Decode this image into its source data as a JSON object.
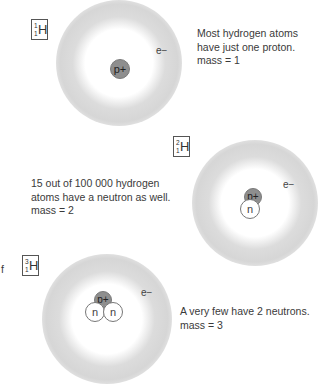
{
  "isotopes": [
    {
      "id": "protium",
      "label": {
        "mass_number": "1",
        "atomic_number": "1",
        "symbol": "H"
      },
      "nucleus": {
        "proton": "p+",
        "neutrons": []
      },
      "electron": "e−",
      "description": [
        "Most hydrogen atoms",
        "have just one proton.",
        "mass = 1"
      ]
    },
    {
      "id": "deuterium",
      "label": {
        "mass_number": "2",
        "atomic_number": "1",
        "symbol": "H"
      },
      "nucleus": {
        "proton": "p+",
        "neutrons": [
          "n"
        ]
      },
      "electron": "e−",
      "description": [
        "15 out of 100 000 hydrogen",
        "atoms have a neutron as well.",
        "mass = 2"
      ]
    },
    {
      "id": "tritium",
      "label": {
        "mass_number": "3",
        "atomic_number": "1",
        "symbol": "H"
      },
      "nucleus": {
        "proton": "p+",
        "neutrons": [
          "n",
          "n"
        ]
      },
      "electron": "e−",
      "description": [
        "A very few have 2 neutrons.",
        "mass = 3"
      ]
    }
  ],
  "edge_fragment": "f",
  "colors": {
    "proton": "#8e8e8e",
    "cloud": "#d6d6d6",
    "text": "#3a3a3a"
  }
}
